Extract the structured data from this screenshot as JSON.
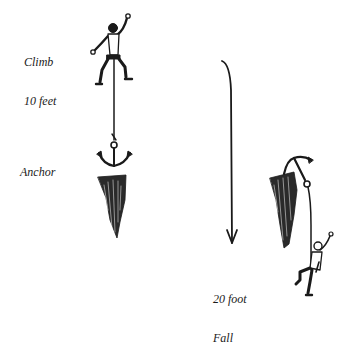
{
  "diagram": {
    "type": "illustration",
    "labels": {
      "climb_line1": "Climb",
      "climb_line2": "10 feet",
      "anchor": "Anchor",
      "fall_line1": "20 foot",
      "fall_line2": "Fall"
    },
    "elements": [
      {
        "name": "climber-above-anchor",
        "description": "climber 10 feet above the anchor, rope running down"
      },
      {
        "name": "anchor-left",
        "description": "anchor placed on rock outcrop"
      },
      {
        "name": "fall-arrow",
        "description": "downward arrow indicating fall direction"
      },
      {
        "name": "anchor-right",
        "description": "anchor on rock holding fallen climber"
      },
      {
        "name": "climber-fallen",
        "description": "climber hanging 10 feet below anchor after 20 foot fall"
      }
    ],
    "colors": {
      "ink": "#1a1a1a",
      "background": "#ffffff"
    }
  }
}
